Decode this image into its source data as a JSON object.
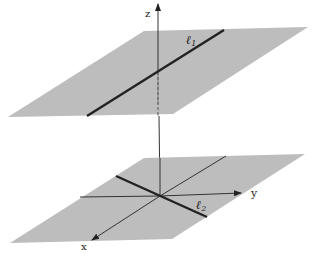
{
  "figure": {
    "colors": {
      "plane": "#bdbdbd",
      "axis": "#333333",
      "line": "#222222",
      "background": "#ffffff"
    },
    "labels": {
      "z_axis": "z",
      "y_axis": "y",
      "x_axis": "x",
      "line1": "ℓ",
      "line1_sub": "1",
      "line2": "ℓ",
      "line2_sub": "2"
    },
    "upper_plane": {
      "points": "144,31 308,27 173,114 8,117"
    },
    "lower_plane": {
      "points": "144,158 305,154 172,239 10,243"
    },
    "line1": {
      "x1": 87,
      "y1": 116,
      "x2": 224,
      "y2": 30
    },
    "line2": {
      "x1": 116,
      "y1": 176,
      "x2": 207,
      "y2": 217
    }
  }
}
